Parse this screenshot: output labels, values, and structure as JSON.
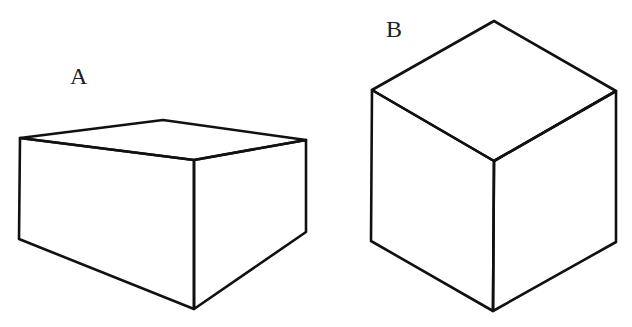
{
  "figure": {
    "stroke_color": "#111111",
    "background": "#ffffff"
  },
  "shapes": [
    {
      "id": "A",
      "label": "A",
      "kind": "rectangular box (two-point perspective)",
      "vertices": {
        "top_left": [
          20,
          138
        ],
        "top_back": [
          163,
          120
        ],
        "top_right": [
          306,
          140
        ],
        "top_front": [
          194,
          160
        ],
        "bottom_left": [
          19,
          239
        ],
        "bottom_right": [
          306,
          232
        ],
        "bottom_front": [
          194,
          309
        ]
      }
    },
    {
      "id": "B",
      "label": "B",
      "kind": "cube (isometric)",
      "vertices": {
        "top_apex": [
          494,
          21
        ],
        "top_left": [
          372,
          90
        ],
        "top_right": [
          616,
          91
        ],
        "top_front": [
          494,
          161
        ],
        "bottom_left": [
          371,
          241
        ],
        "bottom_right": [
          616,
          242
        ],
        "bottom_front": [
          493,
          311
        ]
      }
    }
  ]
}
